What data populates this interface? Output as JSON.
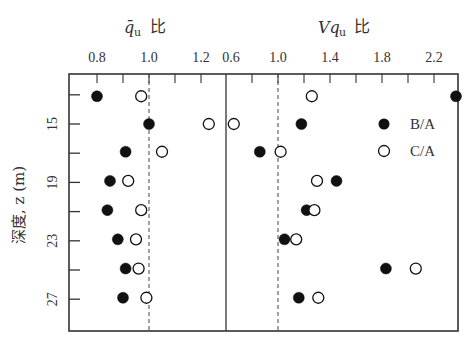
{
  "chart_data": {
    "type": "scatter",
    "layout": "two side-by-side panels sharing an inverted depth axis",
    "ylabel": "深度, z (m)",
    "y_axis": {
      "label": "深度, z (m)",
      "ticks": [
        15,
        19,
        23,
        27
      ],
      "minor_ticks": [
        13,
        17,
        21,
        25
      ],
      "range": [
        11.1,
        29.3
      ],
      "inverted": true
    },
    "legend": {
      "position": "right panel, upper right",
      "entries": [
        {
          "label": "B/A",
          "marker": "filled-circle"
        },
        {
          "label": "C/A",
          "marker": "open-circle"
        }
      ]
    },
    "panels": [
      {
        "title_main": "q̄",
        "title_sub": "u",
        "title_suffix": "比",
        "xlabel": "q̄u 比",
        "x_ticks": [
          "0.8",
          "1.0",
          "1.2"
        ],
        "tick_step": 0.1,
        "xlim": [
          0.7,
          1.3
        ],
        "reference_line": 1.0,
        "series": [
          {
            "name": "B/A",
            "marker": "filled",
            "points": [
              {
                "z": 13.1,
                "value": 0.8
              },
              {
                "z": 15.0,
                "value": 1.0
              },
              {
                "z": 16.9,
                "value": 0.91
              },
              {
                "z": 18.9,
                "value": 0.85
              },
              {
                "z": 20.9,
                "value": 0.84
              },
              {
                "z": 22.9,
                "value": 0.88
              },
              {
                "z": 24.9,
                "value": 0.91
              },
              {
                "z": 26.9,
                "value": 0.9
              }
            ]
          },
          {
            "name": "C/A",
            "marker": "open",
            "points": [
              {
                "z": 13.1,
                "value": 0.97
              },
              {
                "z": 15.0,
                "value": 1.23
              },
              {
                "z": 16.9,
                "value": 1.05
              },
              {
                "z": 18.9,
                "value": 0.92
              },
              {
                "z": 20.9,
                "value": 0.97
              },
              {
                "z": 22.9,
                "value": 0.95
              },
              {
                "z": 24.9,
                "value": 0.96
              },
              {
                "z": 26.9,
                "value": 0.99
              }
            ]
          }
        ]
      },
      {
        "title_main": "Vq",
        "title_sub": "u",
        "title_suffix": "比",
        "xlabel": "Vqu 比",
        "x_ticks": [
          "0.6",
          "1.0",
          "1.4",
          "1.8",
          "2.2"
        ],
        "tick_step": 0.2,
        "xlim": [
          0.6,
          2.4
        ],
        "reference_line": 1.0,
        "series": [
          {
            "name": "B/A",
            "marker": "filled",
            "points": [
              {
                "z": 13.1,
                "value": 2.37
              },
              {
                "z": 15.0,
                "value": 1.18
              },
              {
                "z": 16.9,
                "value": 0.86
              },
              {
                "z": 18.9,
                "value": 1.45
              },
              {
                "z": 20.9,
                "value": 1.22
              },
              {
                "z": 22.9,
                "value": 1.05
              },
              {
                "z": 24.9,
                "value": 1.83
              },
              {
                "z": 26.9,
                "value": 1.16
              }
            ]
          },
          {
            "name": "C/A",
            "marker": "open",
            "points": [
              {
                "z": 13.1,
                "value": 1.26
              },
              {
                "z": 15.0,
                "value": 0.66
              },
              {
                "z": 16.9,
                "value": 1.02
              },
              {
                "z": 18.9,
                "value": 1.3
              },
              {
                "z": 20.9,
                "value": 1.28
              },
              {
                "z": 22.9,
                "value": 1.14
              },
              {
                "z": 24.9,
                "value": 2.06
              },
              {
                "z": 26.9,
                "value": 1.31
              }
            ]
          }
        ]
      }
    ],
    "grid": false
  },
  "labels": {
    "left_title_main": "q̄",
    "left_title_sub": "u",
    "left_title_suffix": "比",
    "right_title_main": "Vq",
    "right_title_sub": "u",
    "right_title_suffix": "比",
    "y_axis_label": "深度, z (m)",
    "legend_ba": "B/A",
    "legend_ca": "C/A"
  },
  "colors": {
    "ink": "#222222",
    "frame": "#333333",
    "background": "#ffffff"
  }
}
